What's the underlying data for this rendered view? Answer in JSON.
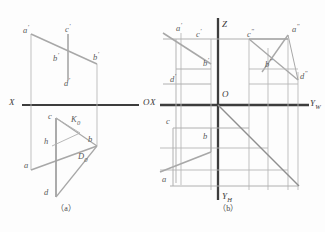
{
  "figure": {
    "title_caption_a": "（a）",
    "title_caption_b": "（b）",
    "colors": {
      "axis": "#3d3d3d",
      "projection_line": "#a9a9a9",
      "object_line": "#8c8c8c",
      "label": "#5a5a5a",
      "background": "#fdfdfd"
    }
  },
  "diagram_a": {
    "name": "two-view-projection",
    "axis": {
      "x_label": "X",
      "origin_label": "O"
    },
    "points": [
      {
        "id": "a-prime",
        "label": "a",
        "sup": "'",
        "x": 23,
        "y": 29
      },
      {
        "id": "c-prime",
        "label": "c",
        "sup": "'",
        "x": 65,
        "y": 28
      },
      {
        "id": "b-prime-upper",
        "label": "b",
        "sup": "'",
        "x": 53,
        "y": 57
      },
      {
        "id": "bb-prime",
        "label": "b",
        "sup": "'",
        "x": 93,
        "y": 56
      },
      {
        "id": "d-prime",
        "label": "d",
        "sup": "'",
        "x": 64,
        "y": 82
      },
      {
        "id": "c-lower",
        "label": "c",
        "sup": "",
        "x": 48,
        "y": 117
      },
      {
        "id": "k0",
        "label": "K",
        "sub": "0",
        "x": 71,
        "y": 120
      },
      {
        "id": "h-lower",
        "label": "h",
        "sup": "",
        "x": 44,
        "y": 142
      },
      {
        "id": "b-lower",
        "label": "b",
        "sup": "",
        "x": 88,
        "y": 140
      },
      {
        "id": "d0",
        "label": "D",
        "sub": "0",
        "x": 78,
        "y": 157
      },
      {
        "id": "a-lower",
        "label": "a",
        "sup": "",
        "x": 24,
        "y": 166
      },
      {
        "id": "d-lower",
        "label": "d",
        "sup": "",
        "x": 44,
        "y": 193
      }
    ]
  },
  "diagram_b": {
    "name": "three-view-projection",
    "axis": {
      "z_label": "Z",
      "x_label": "X",
      "origin_label": "O",
      "yw_label": "Y",
      "yw_sub": "W",
      "yh_label": "Y",
      "yh_sub": "H"
    },
    "points": [
      {
        "id": "a-prime",
        "label": "a",
        "sup": "'",
        "x": 176,
        "y": 27
      },
      {
        "id": "c-prime",
        "label": "c",
        "sup": "'",
        "x": 196,
        "y": 33
      },
      {
        "id": "c-dprime",
        "label": "c",
        "sup": "\"",
        "x": 247,
        "y": 33
      },
      {
        "id": "a-dprime",
        "label": "a",
        "sup": "\"",
        "x": 292,
        "y": 28
      },
      {
        "id": "b-prime",
        "label": "b",
        "sup": "'",
        "x": 203,
        "y": 62
      },
      {
        "id": "b-dprime",
        "label": "b",
        "sup": "\"",
        "x": 265,
        "y": 63
      },
      {
        "id": "d-prime",
        "label": "d",
        "sup": "'",
        "x": 170,
        "y": 78
      },
      {
        "id": "d-dprime",
        "label": "d",
        "sup": "\"",
        "x": 300,
        "y": 75
      },
      {
        "id": "c-lower",
        "label": "c",
        "sup": "",
        "x": 166,
        "y": 122
      },
      {
        "id": "b-lower",
        "label": "b",
        "sup": "",
        "x": 203,
        "y": 137
      },
      {
        "id": "a-lower",
        "label": "a",
        "sup": "",
        "x": 162,
        "y": 180
      }
    ]
  }
}
